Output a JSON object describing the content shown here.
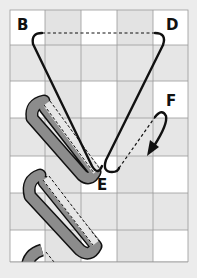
{
  "diagram": {
    "labels": {
      "B": "B",
      "D": "D",
      "E": "E",
      "F": "F"
    },
    "colors": {
      "background": "#ececec",
      "cell_white": "#ffffff",
      "cell_gray": "#e4e4e4",
      "grid_line": "#9a9a9a",
      "strip_fill": "#8c8c8c",
      "path_stroke": "#111111"
    },
    "grid": {
      "columns": 5,
      "rows": 7
    }
  }
}
